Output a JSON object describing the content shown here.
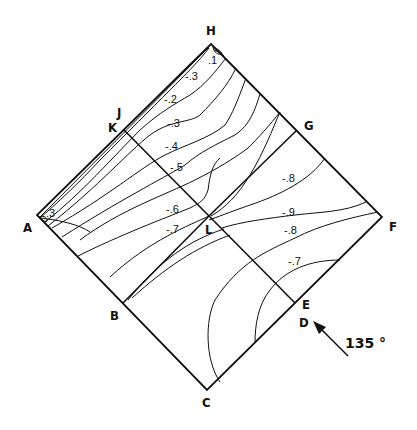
{
  "diagram": {
    "type": "contour-plot on folded square (pressure coefficient map)",
    "vertex_labels": {
      "H": "H",
      "J": "J",
      "K": "K",
      "G": "G",
      "A": "A",
      "L": "L",
      "F": "F",
      "B": "B",
      "E": "E",
      "D": "D",
      "C": "C"
    },
    "wind_direction": {
      "label": "135 °",
      "icon": "arrow-icon"
    },
    "contour_labels": [
      {
        "id": "c1",
        "text": ".1"
      },
      {
        "id": "c2",
        "text": "-.3"
      },
      {
        "id": "c3",
        "text": "-.2"
      },
      {
        "id": "c4",
        "text": "-.3"
      },
      {
        "id": "c5",
        "text": "-.4"
      },
      {
        "id": "c6",
        "text": "-.5"
      },
      {
        "id": "c7",
        "text": "-.6"
      },
      {
        "id": "c8",
        "text": "-.7"
      },
      {
        "id": "c9",
        "text": "-.8"
      },
      {
        "id": "c10",
        "text": "-.9"
      },
      {
        "id": "c11",
        "text": "-.8"
      },
      {
        "id": "c12",
        "text": "-.7"
      },
      {
        "id": "c13",
        "text": ".3"
      }
    ]
  }
}
